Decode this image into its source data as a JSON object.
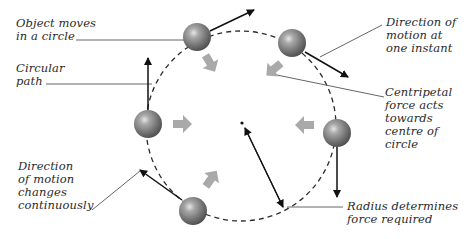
{
  "diagram": {
    "labels": {
      "object_moves": "Object moves\nin a circle",
      "circular_path": "Circular\npath",
      "direction_changes": "Direction\nof motion\nchanges\ncontinuously",
      "direction_instant": "Direction of\nmotion at\none instant",
      "centripetal": "Centripetal\nforce acts\ntowards\ncentre of\ncircle",
      "radius": "Radius determines\nforce required"
    },
    "colors": {
      "sphere": "#7a7a7a",
      "force_arrow": "#a9a9a9",
      "path": "#2b2b2b",
      "leader": "#555555",
      "text": "#2a2a2a"
    }
  }
}
